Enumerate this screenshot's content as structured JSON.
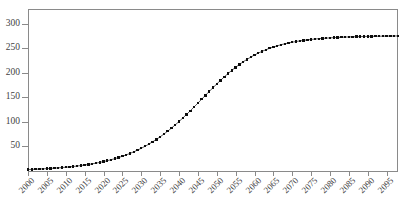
{
  "chart_data": {
    "type": "line",
    "title": "",
    "subtitle": "",
    "xlabel": "",
    "ylabel": "",
    "legend": [],
    "grid": false,
    "marker_style": "filled-square",
    "line_style": "solid-thin-black",
    "xlim": [
      2000,
      2098
    ],
    "ylim": [
      0,
      330
    ],
    "ytick_labels": [
      "50",
      "100",
      "150",
      "200",
      "250",
      "300"
    ],
    "ytick_values": [
      50,
      100,
      150,
      200,
      250,
      300
    ],
    "xtick_labels": [
      "2000",
      "2005",
      "2010",
      "2015",
      "2020",
      "2025",
      "2030",
      "2035",
      "2040",
      "2045",
      "2050",
      "2055",
      "2060",
      "2065",
      "2070",
      "2075",
      "2080",
      "2085",
      "2090",
      "2095"
    ],
    "xtick_values": [
      2000,
      2005,
      2010,
      2015,
      2020,
      2025,
      2030,
      2035,
      2040,
      2045,
      2050,
      2055,
      2060,
      2065,
      2070,
      2075,
      2080,
      2085,
      2090,
      2095
    ],
    "xtick_label_rotation_deg": -45,
    "x": [
      2000,
      2001,
      2002,
      2003,
      2004,
      2005,
      2006,
      2007,
      2008,
      2009,
      2010,
      2011,
      2012,
      2013,
      2014,
      2015,
      2016,
      2017,
      2018,
      2019,
      2020,
      2021,
      2022,
      2023,
      2024,
      2025,
      2026,
      2027,
      2028,
      2029,
      2030,
      2031,
      2032,
      2033,
      2034,
      2035,
      2036,
      2037,
      2038,
      2039,
      2040,
      2041,
      2042,
      2043,
      2044,
      2045,
      2046,
      2047,
      2048,
      2049,
      2050,
      2051,
      2052,
      2053,
      2054,
      2055,
      2056,
      2057,
      2058,
      2059,
      2060,
      2061,
      2062,
      2063,
      2064,
      2065,
      2066,
      2067,
      2068,
      2069,
      2070,
      2071,
      2072,
      2073,
      2074,
      2075,
      2076,
      2077,
      2078,
      2079,
      2080,
      2081,
      2082,
      2083,
      2084,
      2085,
      2086,
      2087,
      2088,
      2089,
      2090,
      2091,
      2092,
      2093,
      2094,
      2095,
      2096,
      2097,
      2098
    ],
    "values": [
      3.0,
      3.3,
      3.6,
      4.0,
      4.4,
      4.8,
      5.3,
      5.8,
      6.4,
      7.0,
      7.7,
      8.4,
      9.2,
      10.1,
      11.1,
      12.2,
      13.3,
      14.6,
      16.0,
      17.5,
      19.2,
      21.0,
      23.0,
      25.1,
      27.5,
      30.0,
      32.8,
      35.8,
      39.0,
      42.5,
      46.3,
      50.3,
      54.7,
      59.3,
      64.3,
      69.6,
      75.2,
      81.1,
      87.4,
      93.9,
      100.8,
      107.9,
      115.2,
      122.8,
      130.5,
      138.3,
      146.2,
      154.1,
      162.0,
      169.7,
      177.3,
      184.7,
      191.8,
      198.6,
      205.1,
      211.2,
      217.0,
      222.4,
      227.4,
      232.0,
      236.3,
      240.2,
      243.8,
      247.0,
      250.0,
      252.6,
      255.0,
      257.2,
      259.1,
      260.8,
      262.4,
      263.8,
      265.0,
      266.1,
      267.1,
      268.0,
      268.8,
      269.5,
      270.1,
      270.7,
      271.2,
      271.7,
      272.1,
      272.4,
      272.8,
      273.1,
      273.3,
      273.6,
      273.8,
      274.0,
      274.2,
      274.3,
      274.5,
      274.6,
      274.7,
      274.8,
      274.9,
      275.0,
      275.1
    ],
    "series_name": "logistic-growth",
    "annotations": []
  }
}
